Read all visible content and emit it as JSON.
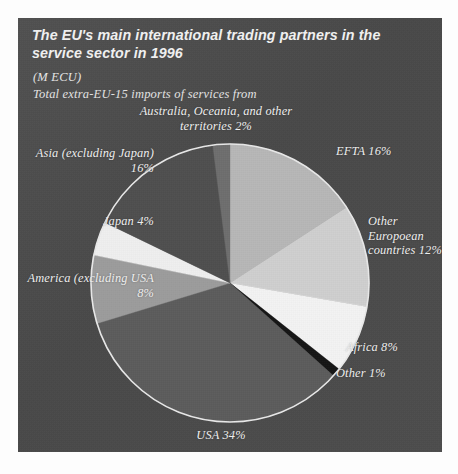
{
  "panel": {
    "title": "The EU's main international trading partners in the service sector in 1996",
    "unit_note": "(M ECU)",
    "sub_note": "Total extra-EU-15 imports of services from",
    "bg_color": "#4b4b4b",
    "text_color": "#f0f0f0"
  },
  "labels": {
    "australia": "Australia, Oceania, and other territories 2%",
    "asia": "Asia (excluding Japan) 16%",
    "japan": "Japan 4%",
    "america": "America (excluding USA 8%",
    "usa": "USA 34%",
    "efta": "EFTA 16%",
    "other_european": "Other Europoean countries 12%",
    "africa": "Africa 8%",
    "other": "Other 1%"
  },
  "chart_data": {
    "type": "pie",
    "title": "The EU's main international trading partners in the service sector in 1996",
    "subtitle": "Total extra-EU-15 imports of services from",
    "unit": "M ECU",
    "start_angle_deg": 0,
    "direction": "clockwise",
    "legend": "none",
    "labels_placement": "outside-callout",
    "categories": [
      "EFTA",
      "Other Europoean countries",
      "Africa",
      "Other",
      "USA",
      "America (excluding USA)",
      "Japan",
      "Asia (excluding Japan)",
      "Australia, Oceania, and other territories"
    ],
    "values": [
      16,
      12,
      8,
      1,
      34,
      8,
      4,
      16,
      2
    ],
    "value_suffix": "%",
    "colors": [
      "#b7b7b7",
      "#cfcfcf",
      "#f3f3f3",
      "#151515",
      "#5c5c5c",
      "#9c9c9c",
      "#efefef",
      "#4f4f4f",
      "#6e6e6e"
    ],
    "slice_outline": "#e9e9e9",
    "total": 101
  }
}
